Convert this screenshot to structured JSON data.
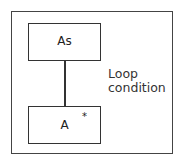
{
  "diagram": {
    "parent_node": {
      "label": "As"
    },
    "child_node": {
      "label": "A",
      "marker": "*"
    },
    "annotation": {
      "line1": "Loop",
      "line2": "condition"
    }
  }
}
